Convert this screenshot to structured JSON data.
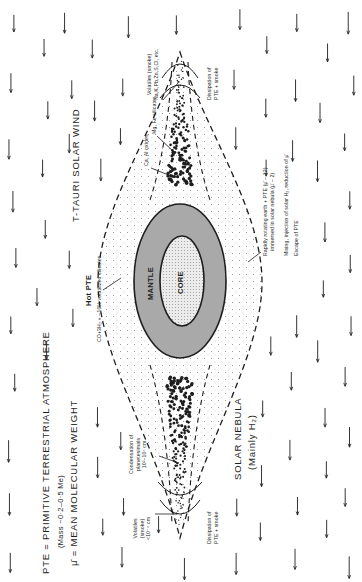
{
  "legend": {
    "pte_definition": "PTE = PRIMITIVE TERRESTRIAL ATMOSPHERE",
    "pte_mass": "(Mass ~0·2–0·5 Me)",
    "mu_definition": "μ̄ = MEAN MOLECULAR WEIGHT"
  },
  "labels": {
    "solar_wind": "T-TAURI SOLAR WIND",
    "solar_nebula": "SOLAR NEBULA",
    "solar_nebula_sub": "(Mainly H₂)",
    "hot_pte": "Hot PTE",
    "hot_pte_composition": "CO+3H₂ + ~10% volatilized silicates",
    "mantle": "MANTLE",
    "core": "CORE",
    "ca_al_oxides": "Ca, Al oxides",
    "mg_fe_silicates": "Mg, Fe silicates",
    "volatiles_top_line1": "Volatiles (smoke)",
    "volatiles_top_line2": "Na,K,Pb,Zn,S,Cl, etc.",
    "dissipation_top_line1": "Dissipation of",
    "dissipation_top_line2": "PTE + smoke",
    "rotating_earth_line1": "Rapidly rotating earth + PTE (μ̄ ~ 12)",
    "rotating_earth_line2": "immersed in solar nebula (μ̄ ~ 2)",
    "mixing": "Mixing, injection of solar H₂, reduction of μ̄",
    "escape": "Escape of PTE",
    "condensation_line1": "Condensation of",
    "condensation_line2": "planetesimals",
    "condensation_line3": "10²–10⁵ cm",
    "volatiles_bottom_line1": "Volatiles",
    "volatiles_bottom_line2": "(smoke)",
    "volatiles_bottom_line3": "<10⁻⁵ cm",
    "dissipation_bottom_line1": "Dissipation of",
    "dissipation_bottom_line2": "PTE + smoke"
  },
  "colors": {
    "ink": "#1e1e1e",
    "mantle_fill": "#a9a9a9",
    "core_fill": "#e6e6e6",
    "background": "#ffffff"
  },
  "icons": {
    "wind_arrow": "down-arrow-icon"
  }
}
